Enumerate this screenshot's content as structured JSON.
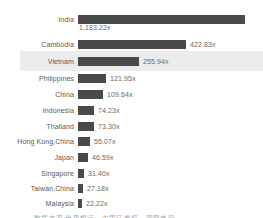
{
  "chart_data": {
    "type": "bar",
    "orientation": "horizontal",
    "title": "",
    "xlabel": "",
    "ylabel": "",
    "categories": [
      "India",
      "Cambodia",
      "Vietnam",
      "Philippines",
      "China",
      "Indonesia",
      "Thailand",
      "Hong Kong,China",
      "Japan",
      "Singapore",
      "Taiwan,China",
      "Malaysia"
    ],
    "values": [
      1183.22,
      422.83,
      255.94,
      121.95,
      109.64,
      74.23,
      73.3,
      55.07,
      46.59,
      31.4,
      27.18,
      22.22
    ],
    "value_labels": [
      "1,183.22x",
      "422.83x",
      "255.94x",
      "121.95x",
      "109.64x",
      "74.23x",
      "73.30x",
      "55.07x",
      "46.59x",
      "31.40x",
      "27.18x",
      "22.22x"
    ],
    "bar_pixel_lengths": [
      167,
      108,
      61,
      28,
      25,
      16,
      16,
      12,
      10,
      6,
      5,
      4
    ],
    "highlighted_category": "Vietnam",
    "grid": false,
    "legend": false,
    "bar_color": "#4a4a4a",
    "highlight_color": "#ececec",
    "label_color": "#58595b",
    "value_color": "#6a6a6a"
  },
  "caption": {
    "text": "数据来源:世界银行、中国证券报、观察者网"
  }
}
